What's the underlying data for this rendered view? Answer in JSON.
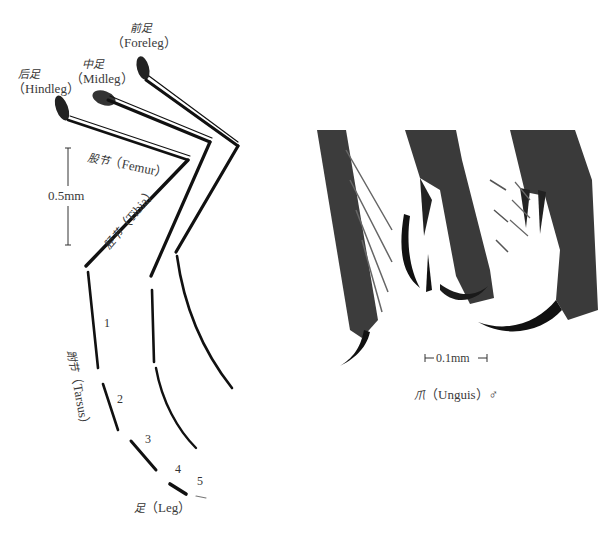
{
  "figure": {
    "left_panel": {
      "title_cn": "足",
      "title_en": "（Leg）",
      "legs": [
        {
          "cn": "前足",
          "en": "（Foreleg）"
        },
        {
          "cn": "中足",
          "en": "（Midleg）"
        },
        {
          "cn": "后足",
          "en": "（Hindleg）"
        }
      ],
      "parts": {
        "femur": {
          "cn": "股节",
          "en": "（Femur）"
        },
        "tibia": {
          "cn": "胫节",
          "en": "（Tibia）"
        },
        "tarsus": {
          "cn": "跗节",
          "en": "（Tarsus）"
        }
      },
      "tarsal_segments": [
        "1",
        "2",
        "3",
        "4",
        "5"
      ],
      "scale_bar": "0.5mm"
    },
    "right_panel": {
      "title_cn": "爪",
      "title_en": "（Unguis）♂",
      "scale_bar": "0.1mm"
    },
    "colors": {
      "leg_stroke": "#111111",
      "micro_fill": "#3c3c3c",
      "text": "#333333",
      "background": "#ffffff"
    }
  }
}
